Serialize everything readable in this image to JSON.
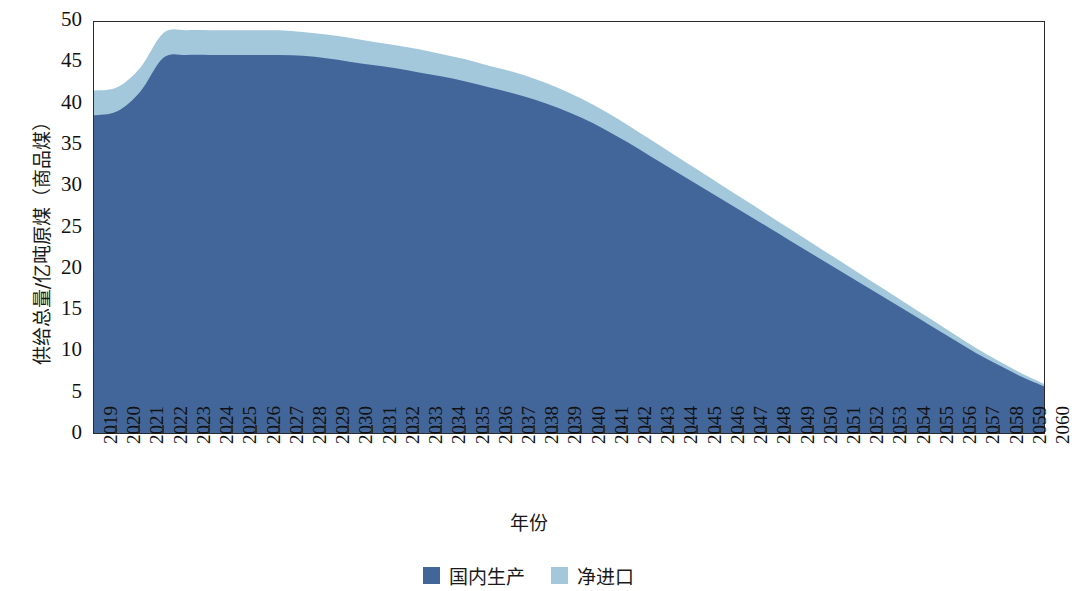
{
  "chart_data": {
    "type": "area",
    "stacked": true,
    "title": "",
    "xlabel": "年份",
    "ylabel": "供给总量/亿吨原煤（商品煤）",
    "ylim": [
      0,
      50
    ],
    "yticks": [
      0,
      5,
      10,
      15,
      20,
      25,
      30,
      35,
      40,
      45,
      50
    ],
    "grid": false,
    "legend_position": "bottom-center",
    "categories": [
      "2019",
      "2020",
      "2021",
      "2022",
      "2023",
      "2024",
      "2025",
      "2026",
      "2027",
      "2028",
      "2029",
      "2030",
      "2031",
      "2032",
      "2033",
      "2034",
      "2035",
      "2036",
      "2037",
      "2038",
      "2039",
      "2040",
      "2041",
      "2042",
      "2043",
      "2044",
      "2045",
      "2046",
      "2047",
      "2048",
      "2049",
      "2050",
      "2051",
      "2052",
      "2053",
      "2054",
      "2055",
      "2056",
      "2057",
      "2058",
      "2059",
      "2060"
    ],
    "series": [
      {
        "name": "国内生产",
        "color": "#43669a",
        "values": [
          38.7,
          39.2,
          41.6,
          45.7,
          46.0,
          46.0,
          46.0,
          46.0,
          46.0,
          45.9,
          45.6,
          45.2,
          44.8,
          44.4,
          43.9,
          43.4,
          42.8,
          42.1,
          41.4,
          40.6,
          39.6,
          38.4,
          37.0,
          35.4,
          33.7,
          32.0,
          30.3,
          28.6,
          26.9,
          25.2,
          23.5,
          21.8,
          20.1,
          18.4,
          16.7,
          15.0,
          13.3,
          11.6,
          9.9,
          8.4,
          7.0,
          5.8
        ]
      },
      {
        "name": "净进口",
        "color": "#a3c8dc",
        "values": [
          3.0,
          2.9,
          2.9,
          3.0,
          3.0,
          3.0,
          3.0,
          3.0,
          3.0,
          2.9,
          2.9,
          2.9,
          2.8,
          2.8,
          2.8,
          2.7,
          2.7,
          2.6,
          2.6,
          2.5,
          2.4,
          2.3,
          2.2,
          2.1,
          2.0,
          1.9,
          1.8,
          1.7,
          1.6,
          1.5,
          1.4,
          1.3,
          1.2,
          1.1,
          1.0,
          0.9,
          0.8,
          0.7,
          0.6,
          0.5,
          0.4,
          0.3
        ]
      }
    ],
    "totals": [
      41.7,
      42.1,
      44.5,
      48.7,
      49.0,
      49.0,
      49.0,
      49.0,
      49.0,
      48.8,
      48.5,
      48.1,
      47.6,
      47.2,
      46.7,
      46.1,
      45.5,
      44.7,
      44.0,
      43.1,
      42.0,
      40.7,
      39.2,
      37.5,
      35.7,
      33.9,
      32.1,
      30.3,
      28.5,
      26.7,
      24.9,
      23.1,
      21.3,
      19.5,
      17.7,
      15.9,
      14.1,
      12.3,
      10.5,
      8.9,
      7.4,
      6.1
    ]
  },
  "axes": {
    "y_title": "供给总量/亿吨原煤（商品煤）",
    "x_title": "年份",
    "y_tick_labels": [
      "50",
      "45",
      "40",
      "35",
      "30",
      "25",
      "20",
      "15",
      "10",
      "5",
      "0"
    ],
    "x_tick_labels": [
      "2019",
      "2020",
      "2021",
      "2022",
      "2023",
      "2024",
      "2025",
      "2026",
      "2027",
      "2028",
      "2029",
      "2030",
      "2031",
      "2032",
      "2033",
      "2034",
      "2035",
      "2036",
      "2037",
      "2038",
      "2039",
      "2040",
      "2041",
      "2042",
      "2043",
      "2044",
      "2045",
      "2046",
      "2047",
      "2048",
      "2049",
      "2050",
      "2051",
      "2052",
      "2053",
      "2054",
      "2055",
      "2056",
      "2057",
      "2058",
      "2059",
      "2060"
    ]
  },
  "legend": {
    "items": [
      {
        "label": "国内生产",
        "color": "#43669a"
      },
      {
        "label": "净进口",
        "color": "#a3c8dc"
      }
    ]
  },
  "colors": {
    "domestic_production": "#43669a",
    "net_import": "#a3c8dc",
    "axis": "#2b2b2b",
    "text": "#111111",
    "background": "#ffffff"
  }
}
